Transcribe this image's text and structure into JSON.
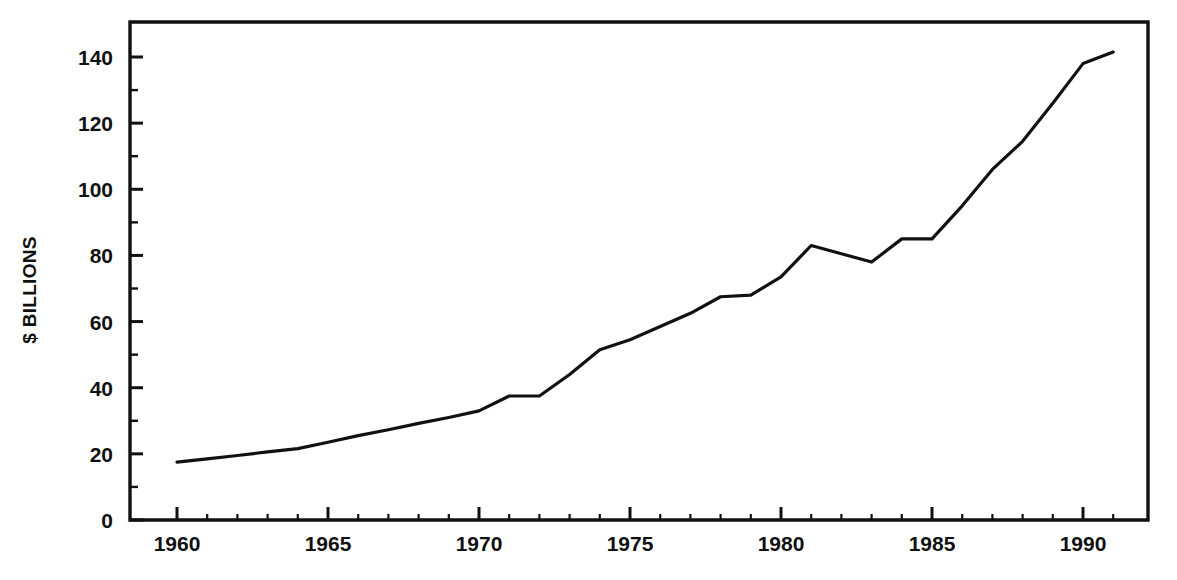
{
  "chart_data": {
    "type": "line",
    "title": "",
    "subtitle": "",
    "xlabel": "",
    "ylabel": "$ BILLIONS",
    "xlim": [
      1959,
      1992
    ],
    "ylim": [
      0,
      150
    ],
    "grid": false,
    "legend": null,
    "legend_position": "none",
    "x_major_ticks": [
      1960,
      1965,
      1970,
      1975,
      1980,
      1985,
      1990
    ],
    "x_tick_labels": [
      "1960",
      "1965",
      "1970",
      "1975",
      "1980",
      "1985",
      "1990"
    ],
    "x_minor_tick_interval": 1,
    "y_major_ticks": [
      0,
      20,
      40,
      60,
      80,
      100,
      120,
      140
    ],
    "y_tick_labels": [
      "0",
      "20",
      "40",
      "60",
      "80",
      "100",
      "120",
      "140"
    ],
    "y_minor_tick_interval": 10,
    "line_color": "#111111",
    "line_width": 3.2,
    "series": [
      {
        "name": "",
        "x": [
          1960,
          1961,
          1962,
          1963,
          1964,
          1965,
          1966,
          1967,
          1968,
          1969,
          1970,
          1971,
          1972,
          1973,
          1974,
          1975,
          1976,
          1977,
          1978,
          1979,
          1980,
          1981,
          1982,
          1983,
          1984,
          1985,
          1986,
          1987,
          1988,
          1989,
          1990,
          1991
        ],
        "values": [
          17.5,
          18.5,
          19.5,
          20.6,
          21.6,
          23.5,
          25.5,
          27.3,
          29.2,
          31.0,
          33.0,
          37.5,
          37.5,
          44.0,
          51.5,
          54.5,
          58.5,
          62.5,
          67.5,
          68.0,
          73.5,
          83.0,
          80.5,
          78.0,
          85.0,
          85.0,
          95.0,
          106.0,
          114.5,
          126.0,
          138.0,
          141.5
        ]
      }
    ]
  },
  "axes": {
    "y_axis_label_text": "$ BILLIONS"
  }
}
